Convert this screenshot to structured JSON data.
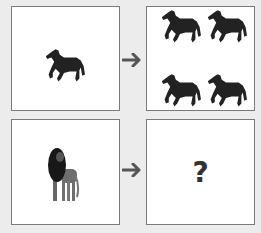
{
  "puzzle": {
    "top_row": {
      "left_box": {
        "animal": "horse",
        "count": 1
      },
      "right_box": {
        "animal": "horse",
        "count": 4
      }
    },
    "bottom_row": {
      "left_box": {
        "animal": "lion",
        "count": 1
      },
      "right_box": {
        "label": "?"
      }
    },
    "arrow_icon": "right-arrow-icon"
  }
}
